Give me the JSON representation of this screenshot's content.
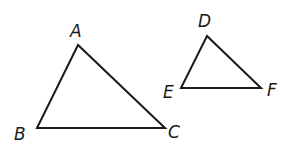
{
  "figure": {
    "stroke_color": "#1a1a1a",
    "triangle_abc": {
      "vertices": {
        "A": {
          "label": "A",
          "x": 78,
          "y": 45,
          "lx": 70,
          "ly": 37
        },
        "B": {
          "label": "B",
          "x": 37,
          "y": 128,
          "lx": 14,
          "ly": 140
        },
        "C": {
          "label": "C",
          "x": 165,
          "y": 128,
          "lx": 168,
          "ly": 138
        }
      }
    },
    "triangle_def": {
      "vertices": {
        "D": {
          "label": "D",
          "x": 207,
          "y": 36,
          "lx": 198,
          "ly": 27
        },
        "E": {
          "label": "E",
          "x": 181,
          "y": 88,
          "lx": 163,
          "ly": 98
        },
        "F": {
          "label": "F",
          "x": 261,
          "y": 88,
          "lx": 267,
          "ly": 96
        }
      }
    }
  }
}
